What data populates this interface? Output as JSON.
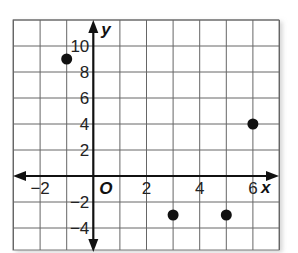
{
  "chart_data": {
    "type": "scatter",
    "title": "",
    "xlabel": "x",
    "ylabel": "y",
    "origin_label": "O",
    "xlim": [
      -3,
      7
    ],
    "ylim": [
      -5,
      12
    ],
    "grid": true,
    "x_step": 1,
    "y_step": 2,
    "x_ticks": [
      -2,
      2,
      4,
      6
    ],
    "y_ticks": [
      -4,
      -2,
      2,
      4,
      6,
      8,
      10
    ],
    "x_tick_labels": [
      "−2",
      "2",
      "4",
      "6"
    ],
    "y_tick_labels": [
      "−4",
      "−2",
      "2",
      "4",
      "6",
      "8",
      "10"
    ],
    "points": [
      {
        "x": -1,
        "y": 9
      },
      {
        "x": 3,
        "y": -3
      },
      {
        "x": 5,
        "y": -3
      },
      {
        "x": 6,
        "y": 4
      }
    ]
  }
}
